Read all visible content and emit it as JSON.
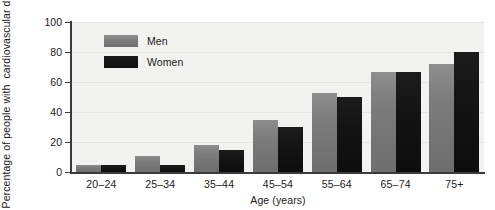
{
  "chart_data": {
    "type": "bar",
    "title": "",
    "xlabel": "Age (years)",
    "ylabel_lines": [
      "Percentage of people with",
      "cardiovascular disease"
    ],
    "ylabel": "Percentage of people with cardiovascular disease",
    "categories": [
      "20–24",
      "25–34",
      "35–44",
      "45–54",
      "55–64",
      "65–74",
      "75+"
    ],
    "series": [
      {
        "name": "Men",
        "color": "#7b7b7b",
        "values": [
          5,
          11,
          18,
          35,
          53,
          67,
          72
        ]
      },
      {
        "name": "Women",
        "color": "#141414",
        "values": [
          5,
          5,
          15,
          30,
          50,
          67,
          80
        ]
      }
    ],
    "ylim": [
      0,
      100
    ],
    "yticks": [
      0,
      20,
      40,
      60,
      80,
      100
    ],
    "ytick_labels": [
      "0",
      "20",
      "40",
      "60",
      "80",
      "100"
    ],
    "grid": true,
    "legend_position": "upper-left-inside",
    "plot_background": "#f2f2f0"
  },
  "legend": {
    "items": [
      {
        "label": "Men"
      },
      {
        "label": "Women"
      }
    ]
  }
}
